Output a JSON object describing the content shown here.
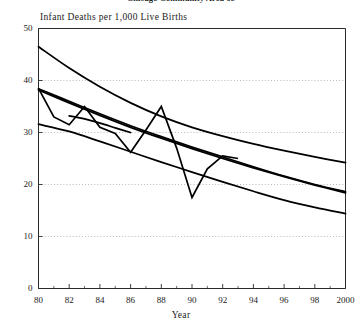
{
  "chart_data": {
    "type": "line",
    "title": "Chicago Community Area 68",
    "xlabel": "Year",
    "ylabel": "Infant Deaths per 1,000 Live Births",
    "xlim": [
      1980,
      2000
    ],
    "ylim": [
      0,
      50
    ],
    "grid": true,
    "legend": "none",
    "y_ticks": [
      0,
      10,
      20,
      30,
      40,
      50
    ],
    "y_tick_labels": [
      "0",
      "10",
      "20",
      "30",
      "40",
      "50"
    ],
    "x_ticks": [
      1980,
      1982,
      1984,
      1986,
      1988,
      1990,
      1992,
      1994,
      1996,
      1998,
      2000
    ],
    "x_tick_labels": [
      "80",
      "82",
      "84",
      "86",
      "88",
      "90",
      "92",
      "94",
      "96",
      "98",
      "2000"
    ],
    "x_minor_ticks": [
      1981,
      1983,
      1985,
      1987,
      1989,
      1991,
      1993,
      1995,
      1997,
      1999
    ],
    "series": [
      {
        "name": "observed-rate",
        "style": "jagged",
        "x": [
          1980,
          1981,
          1982,
          1983,
          1984,
          1985,
          1986,
          1987,
          1988,
          1989,
          1990,
          1991,
          1992,
          1993
        ],
        "values": [
          38.5,
          33.0,
          31.5,
          35.0,
          31.0,
          29.8,
          26.2,
          30.5,
          35.0,
          27.0,
          17.5,
          23.0,
          25.5,
          25.0
        ]
      },
      {
        "name": "trend-upper",
        "style": "smooth",
        "x": [
          1980,
          1982,
          1984,
          1986,
          1988,
          1990,
          1992,
          1994,
          1996,
          1998,
          2000
        ],
        "values": [
          46.5,
          42.4,
          38.8,
          35.7,
          33.1,
          31.0,
          29.3,
          27.8,
          26.5,
          25.3,
          24.2
        ]
      },
      {
        "name": "trend-middle-a",
        "style": "smooth",
        "x": [
          1980,
          1982,
          1984,
          1986,
          1988,
          1990,
          1992,
          1994,
          1996,
          1998,
          2000
        ],
        "values": [
          38.4,
          36.0,
          33.6,
          31.3,
          29.2,
          27.2,
          25.3,
          23.4,
          21.6,
          20.0,
          18.6
        ]
      },
      {
        "name": "trend-middle-b",
        "style": "smooth",
        "x": [
          1980,
          1982,
          1984,
          1986,
          1988,
          1990,
          1992,
          1994,
          1996,
          1998,
          2000
        ],
        "values": [
          38.2,
          35.7,
          33.3,
          31.0,
          28.9,
          26.9,
          25.0,
          23.2,
          21.5,
          19.9,
          18.4
        ]
      },
      {
        "name": "trend-lower",
        "style": "smooth",
        "x": [
          1980,
          1982,
          1984,
          1986,
          1988,
          1990,
          1992,
          1994,
          1996,
          1998,
          2000
        ],
        "values": [
          31.6,
          30.2,
          28.3,
          26.3,
          24.3,
          22.4,
          20.5,
          18.7,
          17.0,
          15.6,
          14.4
        ]
      },
      {
        "name": "trend-short-segment",
        "style": "smooth",
        "x": [
          1982,
          1983,
          1984,
          1985,
          1986
        ],
        "values": [
          33.2,
          32.6,
          31.8,
          30.9,
          30.0
        ]
      }
    ]
  }
}
